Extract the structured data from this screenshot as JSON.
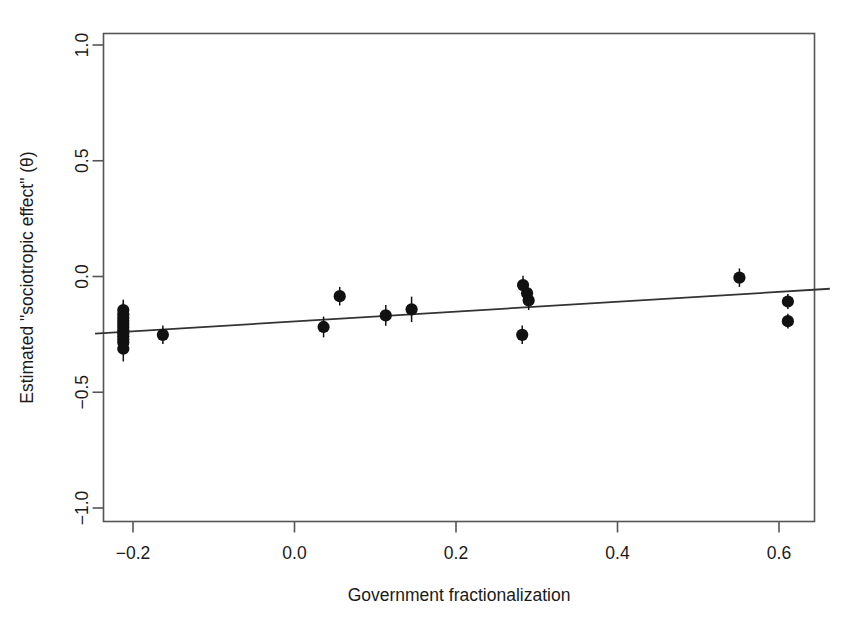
{
  "chart_data": {
    "type": "scatter",
    "title": "",
    "subtitle": "",
    "xlabel": "Government fractionalization",
    "ylabel": "Estimated \"sociotropic effect\" (θ)",
    "xlim": [
      -0.29,
      0.665
    ],
    "ylim": [
      -1.16,
      1.06
    ],
    "xticks": [
      -0.2,
      0.0,
      0.2,
      0.4,
      0.6
    ],
    "xticklabels": [
      "-0.2",
      "0.0",
      "0.2",
      "0.4",
      "0.6"
    ],
    "yticks": [
      1.0,
      0.5,
      0.0,
      -0.5,
      -1.0
    ],
    "yticklabels": [
      "1.0",
      "0.5",
      "0.0",
      "-0.5",
      "-1.0"
    ],
    "grid": false,
    "legend": null,
    "marker_color": "#111111",
    "line_color": "#333333",
    "frame_color": "#555555",
    "error_bars": "vertical",
    "points": [
      {
        "x": -0.212,
        "y": -0.145,
        "err": 0.045
      },
      {
        "x": -0.212,
        "y": -0.163,
        "err": 0.05
      },
      {
        "x": -0.212,
        "y": -0.178,
        "err": 0.05
      },
      {
        "x": -0.212,
        "y": -0.192,
        "err": 0.05
      },
      {
        "x": -0.212,
        "y": -0.205,
        "err": 0.05
      },
      {
        "x": -0.212,
        "y": -0.218,
        "err": 0.05
      },
      {
        "x": -0.212,
        "y": -0.232,
        "err": 0.05
      },
      {
        "x": -0.212,
        "y": -0.245,
        "err": 0.05
      },
      {
        "x": -0.212,
        "y": -0.258,
        "err": 0.05
      },
      {
        "x": -0.212,
        "y": -0.272,
        "err": 0.05
      },
      {
        "x": -0.212,
        "y": -0.285,
        "err": 0.05
      },
      {
        "x": -0.212,
        "y": -0.312,
        "err": 0.055
      },
      {
        "x": -0.163,
        "y": -0.252,
        "err": 0.04
      },
      {
        "x": 0.036,
        "y": -0.218,
        "err": 0.045
      },
      {
        "x": 0.056,
        "y": -0.085,
        "err": 0.04
      },
      {
        "x": 0.113,
        "y": -0.168,
        "err": 0.045
      },
      {
        "x": 0.145,
        "y": -0.142,
        "err": 0.055
      },
      {
        "x": 0.283,
        "y": -0.037,
        "err": 0.04
      },
      {
        "x": 0.288,
        "y": -0.072,
        "err": 0.035
      },
      {
        "x": 0.29,
        "y": -0.103,
        "err": 0.042
      },
      {
        "x": 0.282,
        "y": -0.252,
        "err": 0.04
      },
      {
        "x": 0.551,
        "y": -0.005,
        "err": 0.04
      },
      {
        "x": 0.611,
        "y": -0.108,
        "err": 0.032
      },
      {
        "x": 0.611,
        "y": -0.193,
        "err": 0.032
      }
    ],
    "fit_line": {
      "x_start": -0.247,
      "y_start": -0.247,
      "x_end": 0.663,
      "y_end": -0.053,
      "slope": 0.213,
      "intercept": -0.194
    }
  }
}
